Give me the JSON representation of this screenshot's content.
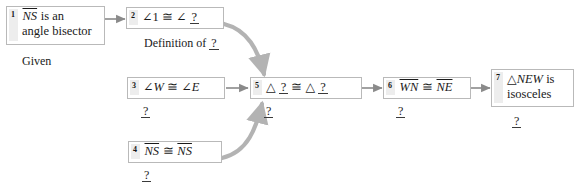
{
  "diagram": {
    "box_border_color": "#b9b9b9",
    "number_tab_color": "#ededed",
    "arrow_color": "#8a8a8a",
    "curved_arrow_color": "#9e9e9e",
    "text_color": "#1a1a1a"
  },
  "steps": [
    {
      "number": "1",
      "statement_line1_prefix": "NS",
      "statement_line1_suffix": " is an",
      "statement_line2": "angle bisector",
      "reason": "Given"
    },
    {
      "number": "2",
      "angle_symbol": "∠",
      "left_operand": "1",
      "congruent_symbol": "≅",
      "right_operand": "?",
      "reason_prefix": "Definition of ",
      "reason_blank": "?"
    },
    {
      "number": "3",
      "angle_symbol": "∠",
      "left_operand": "W",
      "congruent_symbol": "≅",
      "right_angle_symbol": "∠",
      "right_operand": "E",
      "reason": "?"
    },
    {
      "number": "4",
      "left_segment": "NS",
      "congruent_symbol": "≅",
      "right_segment": "NS",
      "reason": "?"
    },
    {
      "number": "5",
      "triangle_symbol": "△",
      "left_operand": "?",
      "congruent_symbol": "≅",
      "right_triangle_symbol": "△",
      "right_operand": "?",
      "reason": "?"
    },
    {
      "number": "6",
      "left_segment": "WN",
      "congruent_symbol": "≅",
      "right_segment": "NE",
      "reason": "?"
    },
    {
      "number": "7",
      "triangle_symbol": "△",
      "statement_line1_name": "NEW",
      "statement_line1_suffix": " is",
      "statement_line2": "isosceles",
      "reason": "?"
    }
  ]
}
